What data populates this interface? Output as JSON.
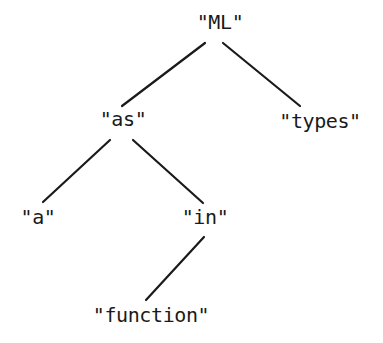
{
  "figure": {
    "kind": "parse-tree-diagram",
    "width": 383,
    "height": 343,
    "background_color": "#ffffff",
    "text_color": "#1a1a1a",
    "edge_color": "#1a1a1a",
    "edge_width": 2.2
  },
  "tree": {
    "nodes": [
      {
        "id": "root",
        "label": "\"ML\"",
        "x": 220,
        "y": 22,
        "depth": 0
      },
      {
        "id": "as",
        "label": "\"as\"",
        "x": 123,
        "y": 119,
        "depth": 1
      },
      {
        "id": "types",
        "label": "\"types\"",
        "x": 320,
        "y": 121,
        "depth": 1
      },
      {
        "id": "a",
        "label": "\"a\"",
        "x": 38,
        "y": 217,
        "depth": 2
      },
      {
        "id": "in",
        "label": "\"in\"",
        "x": 205,
        "y": 217,
        "depth": 2
      },
      {
        "id": "function",
        "label": "\"function\"",
        "x": 151,
        "y": 315,
        "depth": 3
      }
    ],
    "edges": [
      {
        "from": "root",
        "to": "as",
        "x1": 205,
        "y1": 43,
        "x2": 122,
        "y2": 106
      },
      {
        "from": "root",
        "to": "types",
        "x1": 223,
        "y1": 43,
        "x2": 300,
        "y2": 106
      },
      {
        "from": "as",
        "to": "a",
        "x1": 110,
        "y1": 140,
        "x2": 43,
        "y2": 202
      },
      {
        "from": "as",
        "to": "in",
        "x1": 133,
        "y1": 140,
        "x2": 203,
        "y2": 203
      },
      {
        "from": "in",
        "to": "function",
        "x1": 204,
        "y1": 237,
        "x2": 146,
        "y2": 300
      }
    ]
  }
}
